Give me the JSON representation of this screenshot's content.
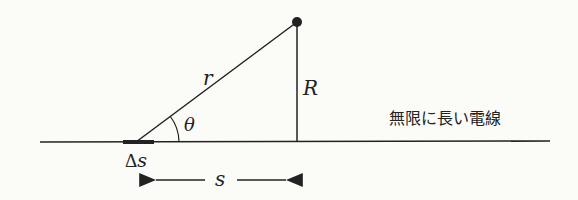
{
  "diagram": {
    "type": "geometry",
    "labels": {
      "hypotenuse": "r",
      "height": "R",
      "angle": "θ",
      "element_delta": "Δ",
      "element_s": "s",
      "distance": "s",
      "wire": "無限に長い電線"
    },
    "colors": {
      "line": "#222222",
      "background": "#fbfbf8"
    }
  }
}
